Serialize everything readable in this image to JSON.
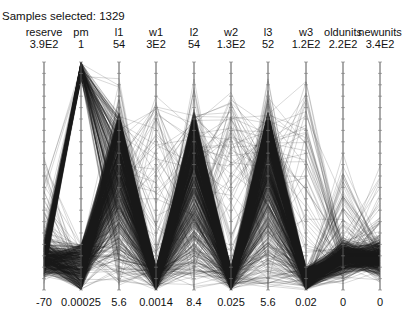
{
  "header": {
    "title": "Samples selected: 1329"
  },
  "chart_data": {
    "type": "parallel_coordinates",
    "title": "Samples selected: 1329",
    "sample_count": 1329,
    "line_color": "#1a1a1a",
    "axes": [
      {
        "name": "reserve",
        "max": "3.9E2",
        "min": "-70",
        "x": 44,
        "profile": "low"
      },
      {
        "name": "pm",
        "max": "1",
        "min": "0.00025",
        "x": 81,
        "profile": "bimodal_top"
      },
      {
        "name": "l1",
        "max": "54",
        "min": "5.6",
        "x": 119,
        "profile": "peak_mid"
      },
      {
        "name": "w1",
        "max": "3E2",
        "min": "0.0014",
        "x": 156,
        "profile": "bottom"
      },
      {
        "name": "l2",
        "max": "54",
        "min": "8.4",
        "x": 194,
        "profile": "peak_mid"
      },
      {
        "name": "w2",
        "max": "1.3E2",
        "min": "0.025",
        "x": 231,
        "profile": "bottom"
      },
      {
        "name": "l3",
        "max": "52",
        "min": "5.6",
        "x": 268,
        "profile": "peak_mid"
      },
      {
        "name": "w3",
        "max": "1.2E2",
        "min": "0.02",
        "x": 306,
        "profile": "bottom"
      },
      {
        "name": "oldunits",
        "max": "2.2E2",
        "min": "0",
        "x": 343,
        "profile": "low"
      },
      {
        "name": "newunits",
        "max": "3.4E2",
        "min": "0",
        "x": 380,
        "profile": "low"
      }
    ],
    "plot_area": {
      "top": 62,
      "bottom": 290
    },
    "grid": false,
    "legend": "none"
  }
}
